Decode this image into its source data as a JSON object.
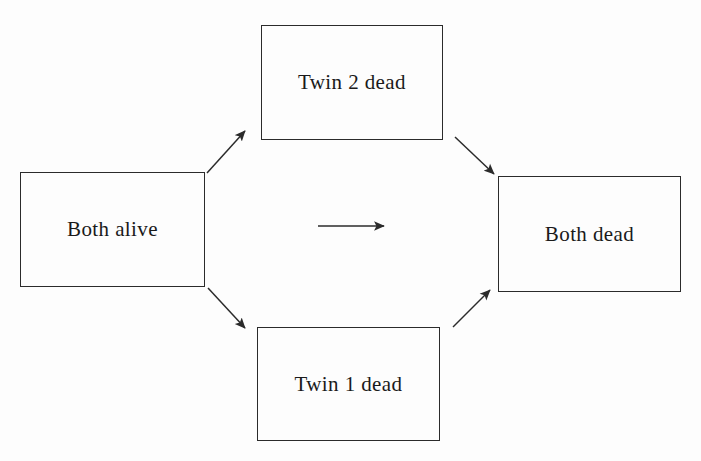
{
  "diagram": {
    "background_color": "#fefefe",
    "stroke_color": "#2b2b2b",
    "text_color": "#1a1a1a",
    "width": 701,
    "height": 461,
    "nodes": [
      {
        "id": "both-alive",
        "label": "Both alive",
        "x": 20,
        "y": 172,
        "width": 185,
        "height": 115
      },
      {
        "id": "twin-2-dead",
        "label": "Twin 2 dead",
        "x": 261,
        "y": 25,
        "width": 182,
        "height": 115
      },
      {
        "id": "twin-1-dead",
        "label": "Twin 1 dead",
        "x": 257,
        "y": 327,
        "width": 183,
        "height": 114
      },
      {
        "id": "both-dead",
        "label": "Both dead",
        "x": 498,
        "y": 176,
        "width": 183,
        "height": 116
      }
    ],
    "edges": [
      {
        "id": "both-alive-to-twin-2-dead",
        "from": "both-alive",
        "to": "twin-2-dead",
        "label": "",
        "x1": 207,
        "y1": 173,
        "x2": 245,
        "y2": 131
      },
      {
        "id": "both-alive-to-twin-1-dead",
        "from": "both-alive",
        "to": "twin-1-dead",
        "label": "",
        "x1": 208,
        "y1": 288,
        "x2": 245,
        "y2": 328
      },
      {
        "id": "twin-2-dead-to-both-dead",
        "from": "twin-2-dead",
        "to": "both-dead",
        "label": "",
        "x1": 455,
        "y1": 137,
        "x2": 494,
        "y2": 174
      },
      {
        "id": "twin-1-dead-to-both-dead",
        "from": "twin-1-dead",
        "to": "both-dead",
        "label": "",
        "x1": 453,
        "y1": 327,
        "x2": 490,
        "y2": 290
      },
      {
        "id": "both-alive-to-both-dead-direct",
        "from": "both-alive",
        "to": "both-dead",
        "label": "",
        "x1": 318,
        "y1": 226,
        "x2": 384,
        "y2": 226
      }
    ]
  }
}
